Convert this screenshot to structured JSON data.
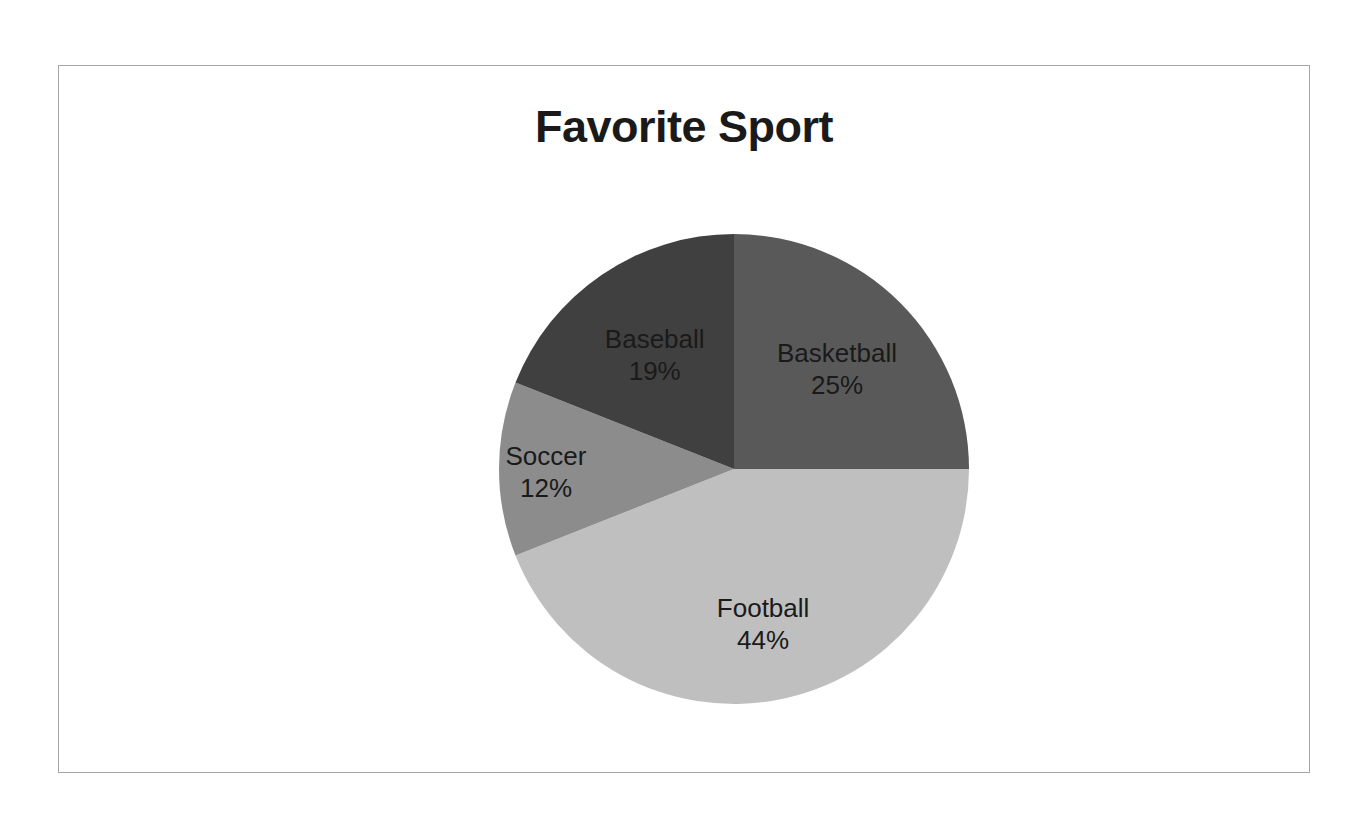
{
  "chart": {
    "title": "Favorite Sport",
    "background_color": "#ffffff",
    "border_color": "#a6a6a6",
    "label_color": "#1a1a1a"
  },
  "chart_data": {
    "type": "pie",
    "title": "Favorite Sport",
    "xlabel": "",
    "ylabel": "",
    "legend_position": "none",
    "grid": false,
    "start_angle_deg": 0,
    "direction": "clockwise",
    "categories": [
      "Basketball",
      "Football",
      "Soccer",
      "Baseball"
    ],
    "values": [
      25,
      44,
      12,
      19
    ],
    "unit": "%",
    "slices": [
      {
        "label": "Basketball",
        "value": 25,
        "value_label": "25%",
        "color": "#595959",
        "start_deg": 0,
        "end_deg": 90
      },
      {
        "label": "Football",
        "value": 44,
        "value_label": "44%",
        "color": "#bfbfbf",
        "start_deg": 90,
        "end_deg": 248.4
      },
      {
        "label": "Soccer",
        "value": 12,
        "value_label": "12%",
        "color": "#8c8c8c",
        "start_deg": 248.4,
        "end_deg": 291.6
      },
      {
        "label": "Baseball",
        "value": 19,
        "value_label": "19%",
        "color": "#404040",
        "start_deg": 291.6,
        "end_deg": 360
      }
    ]
  }
}
